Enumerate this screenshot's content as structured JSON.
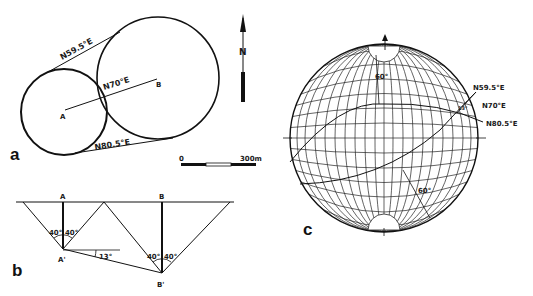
{
  "figure": {
    "panels": {
      "a": {
        "label": "a",
        "point_a": "A",
        "point_b": "B",
        "line_ab_bearing": "N70°E",
        "upper_tangent_bearing": "N59.5°E",
        "lower_tangent_bearing": "N80.5°E",
        "north_arrow": "N",
        "scale_bar": {
          "start": "0",
          "end": "300m"
        }
      },
      "b": {
        "label": "b",
        "point_a": "A",
        "point_b": "B",
        "point_a_prime": "A'",
        "point_b_prime": "B'",
        "angle_a_left": "40°",
        "angle_a_right": "40°",
        "angle_b_left": "40°",
        "angle_b_right": "40°",
        "plunge_angle": "13°"
      },
      "c": {
        "label": "c",
        "upper_dip": "60°",
        "lower_dip": "60°",
        "bearing_1": "N59.5°E",
        "bearing_2": "N70°E",
        "bearing_3": "N80.5°E",
        "small_angle": "13°"
      }
    }
  }
}
